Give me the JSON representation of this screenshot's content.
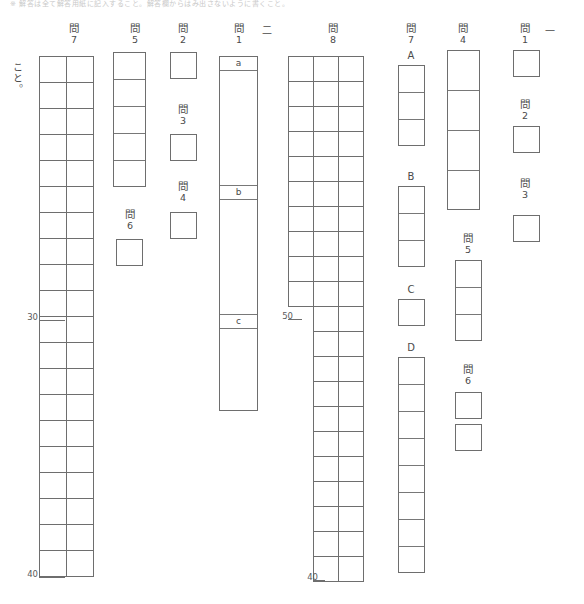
{
  "sheet": {
    "top_instruction": "※ 解答は全て解答用紙に記入すること。解答欄からはみ出さないように書くこと。",
    "vertical_note": "こと。"
  },
  "sections": [
    {
      "id": "section-1",
      "marker": "一",
      "questions": [
        {
          "id": "s1-q1",
          "kanji": "問",
          "num": "1",
          "cells": 1,
          "layout": "single"
        },
        {
          "id": "s1-q2",
          "kanji": "問",
          "num": "2",
          "cells": 1,
          "layout": "single"
        },
        {
          "id": "s1-q3",
          "kanji": "問",
          "num": "3",
          "cells": 1,
          "layout": "single"
        },
        {
          "id": "s1-q4",
          "kanji": "問",
          "num": "4",
          "cells": 4,
          "layout": "stack"
        },
        {
          "id": "s1-q5",
          "kanji": "問",
          "num": "5",
          "cells": 3,
          "layout": "stack"
        },
        {
          "id": "s1-q6",
          "kanji": "問",
          "num": "6",
          "cells": 2,
          "layout": "separate"
        },
        {
          "id": "s1-q7",
          "kanji": "問",
          "num": "7",
          "layout": "labelled",
          "parts": [
            {
              "label": "A",
              "cells": 3
            },
            {
              "label": "B",
              "cells": 3
            },
            {
              "label": "C",
              "cells": 1
            },
            {
              "label": "D",
              "cells": 8
            }
          ]
        }
      ]
    },
    {
      "id": "section-2",
      "marker": "二",
      "questions": [
        {
          "id": "s2-q8",
          "kanji": "問",
          "num": "8",
          "layout": "composition-grid",
          "top_cols": 3,
          "top_rows": 10,
          "bottom_cols": 2,
          "bottom_rows": 13,
          "markers": [
            "50",
            "40"
          ]
        },
        {
          "id": "s2-q1",
          "kanji": "問",
          "num": "1",
          "layout": "abc",
          "parts": [
            {
              "label": "a"
            },
            {
              "label": "b"
            },
            {
              "label": "c"
            }
          ]
        },
        {
          "id": "s2-q2",
          "kanji": "問",
          "num": "2",
          "cells": 1,
          "layout": "single"
        },
        {
          "id": "s2-q3",
          "kanji": "問",
          "num": "3",
          "cells": 1,
          "layout": "single"
        },
        {
          "id": "s2-q4",
          "kanji": "問",
          "num": "4",
          "cells": 1,
          "layout": "single"
        },
        {
          "id": "s2-q5",
          "kanji": "問",
          "num": "5",
          "cells": 5,
          "layout": "stack"
        },
        {
          "id": "s2-q6",
          "kanji": "問",
          "num": "6",
          "cells": 1,
          "layout": "single"
        },
        {
          "id": "s2-q7",
          "kanji": "問",
          "num": "7",
          "layout": "composition-grid",
          "cols": 2,
          "rows": 20,
          "markers": [
            "30",
            "40"
          ]
        }
      ]
    },
    {
      "id": "labels-abc",
      "values": {
        "a": "a",
        "b": "b",
        "c": "c",
        "A": "A",
        "B": "B",
        "C": "C",
        "D": "D"
      }
    }
  ],
  "markers": {
    "thirty": "30",
    "forty": "40",
    "forty_b": "40",
    "fifty": "50"
  },
  "colors": {
    "border": "#6e6e6e",
    "inner_border": "#787878",
    "text": "#4a4a4a",
    "background": "#ffffff"
  }
}
